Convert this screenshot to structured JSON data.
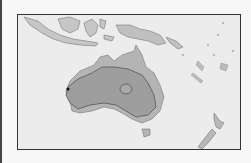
{
  "map": {
    "region": "Australia and Oceania",
    "colors": {
      "ocean": "#ececec",
      "land": "#b4b4b4",
      "range": "#9a9a9a",
      "outline": "#555555",
      "frame": "#333333"
    },
    "features": {
      "range_area": "shaded interior region of Australia",
      "center_marker": "ellipse in central Australia",
      "point_marker": "dot on west coast of Australia"
    }
  }
}
